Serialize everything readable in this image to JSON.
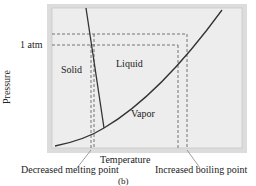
{
  "diagram": {
    "type": "phase diagram",
    "y_axis_label": "Pressure",
    "x_axis_label": "Temperature",
    "pressure_marker": "1 atm",
    "regions": {
      "solid": "Solid",
      "liquid": "Liquid",
      "vapor": "Vapor"
    },
    "annotations": {
      "melting": "Decreased melting point",
      "boiling": "Increased boiling point"
    },
    "caption": "(b)",
    "colors": {
      "frame_outer": "#d9d9d9",
      "plot_fill": "#ececec",
      "line": "#333333",
      "dashed": "#555555"
    }
  }
}
